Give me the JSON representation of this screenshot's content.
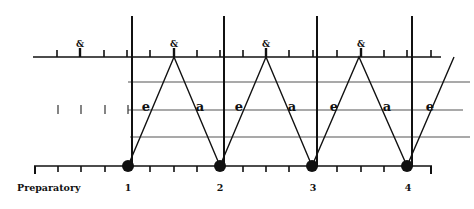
{
  "diagram": {
    "type": "conducting-beat-pattern",
    "colors": {
      "ink": "#111111",
      "guide": "#555555",
      "background": "#ffffff"
    },
    "labels": {
      "preparatory": "Preparatory",
      "beats": [
        "1",
        "2",
        "3",
        "4"
      ],
      "and_marker": "&",
      "ictus_markers": [
        "e",
        "a",
        "e",
        "a",
        "e",
        "a",
        "e"
      ]
    }
  }
}
